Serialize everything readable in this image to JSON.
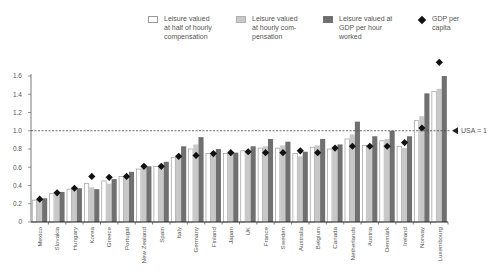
{
  "chart_data": {
    "type": "bar",
    "title": "",
    "xlabel": "",
    "ylabel": "",
    "ylim": [
      0,
      1.6
    ],
    "yticks": [
      "0",
      "0.2",
      "0.4",
      "0.6",
      "0.8",
      "1.0",
      "1.2",
      "1.4",
      "1.6"
    ],
    "grid": false,
    "legend_position": "top",
    "categories": [
      "Mexico",
      "Slovakia",
      "Hungary",
      "Korea",
      "Greece",
      "Portugal",
      "New Zealand",
      "Spain",
      "Italy",
      "Germany",
      "Finland",
      "Japan",
      "UK",
      "France",
      "Sweden",
      "Australia",
      "Belgium",
      "Canada",
      "Netherlands",
      "Austria",
      "Denmark",
      "Ireland",
      "Norway",
      "Luxembourg"
    ],
    "series": [
      {
        "name": "Leisure valued at half of hourly compensation",
        "kind": "bar",
        "color": "#ffffff",
        "values": [
          0.24,
          0.31,
          0.36,
          0.42,
          0.45,
          0.5,
          0.58,
          0.61,
          0.71,
          0.8,
          0.75,
          0.75,
          0.78,
          0.81,
          0.81,
          0.75,
          0.82,
          0.8,
          0.91,
          0.84,
          0.89,
          0.83,
          1.11,
          1.43
        ]
      },
      {
        "name": "Leisure valued at hourly compensation",
        "kind": "bar",
        "color": "#c8c8c8",
        "values": [
          0.24,
          0.3,
          0.35,
          0.38,
          0.42,
          0.51,
          0.6,
          0.62,
          0.72,
          0.85,
          0.77,
          0.76,
          0.79,
          0.83,
          0.84,
          0.72,
          0.84,
          0.82,
          0.96,
          0.84,
          0.91,
          0.81,
          1.16,
          1.46
        ]
      },
      {
        "name": "Leisure valued at GDP per hour worked",
        "kind": "bar",
        "color": "#707070",
        "values": [
          0.26,
          0.33,
          0.37,
          0.36,
          0.47,
          0.55,
          0.61,
          0.66,
          0.83,
          0.93,
          0.8,
          0.76,
          0.83,
          0.91,
          0.88,
          0.77,
          0.91,
          0.85,
          1.1,
          0.94,
          1.0,
          0.94,
          1.41,
          1.6
        ]
      },
      {
        "name": "GDP per capita",
        "kind": "marker",
        "marker": "diamond",
        "color": "#111111",
        "values": [
          0.25,
          0.32,
          0.37,
          0.5,
          0.49,
          0.5,
          0.61,
          0.61,
          0.72,
          0.73,
          0.75,
          0.76,
          0.77,
          0.76,
          0.76,
          0.78,
          0.76,
          0.81,
          0.83,
          0.83,
          0.83,
          0.87,
          1.03,
          1.75
        ]
      }
    ],
    "reference_line": {
      "value": 1.0,
      "label": "USA = 1",
      "style": "dashed"
    }
  },
  "legend": [
    {
      "label": "Leisure valued\nat half of hourly\ncompensation",
      "swatch": "white"
    },
    {
      "label": "Leisure valued\nat hourly com-\npensation",
      "swatch": "light-gray"
    },
    {
      "label": "Leisure valued at\nGDP per hour\nworked",
      "swatch": "dark-gray"
    },
    {
      "label": "GDP per\ncapita",
      "swatch": "diamond"
    }
  ],
  "reference_label": "USA = 1",
  "colors": {
    "white_bar": "#ffffff",
    "white_border": "#9a9a9a",
    "light_bar": "#c8c8c8",
    "dark_bar": "#707070",
    "marker": "#111111",
    "axis": "#333333",
    "text": "#555555"
  }
}
